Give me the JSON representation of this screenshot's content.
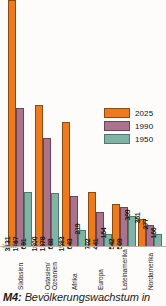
{
  "caption": {
    "code": "M4:",
    "text": "Bevölkerungswachstum in"
  },
  "origin_note": "3881/1",
  "legend": {
    "items": [
      {
        "label": "2025",
        "color": "#ee7a1e"
      },
      {
        "label": "1990",
        "color": "#a9748c"
      },
      {
        "label": "1950",
        "color": "#80b3a5"
      }
    ]
  },
  "chart_data": {
    "type": "bar",
    "title": "Bevölkerungswachstum in",
    "xlabel": "",
    "ylabel": "",
    "ylim": [
      0,
      3131
    ],
    "grid": false,
    "legend_position": "right-middle",
    "categories": [
      "Südasien",
      "Ostasien/\nOzeanien",
      "Afrika",
      "Europa",
      "Lateinamerika",
      "Nordamerika"
    ],
    "series": [
      {
        "name": "2025",
        "color": "#ee7a1e",
        "values": [
          3131,
          1800,
          1583,
          702,
          542,
          361
        ]
      },
      {
        "name": "1990",
        "color": "#a9748c",
        "values": [
          1767,
          1378,
          643,
          441,
          509,
          277
        ]
      },
      {
        "name": "1950",
        "color": "#80b3a5",
        "values": [
          691,
          688,
          219,
          164,
          399,
          166
        ]
      }
    ]
  }
}
